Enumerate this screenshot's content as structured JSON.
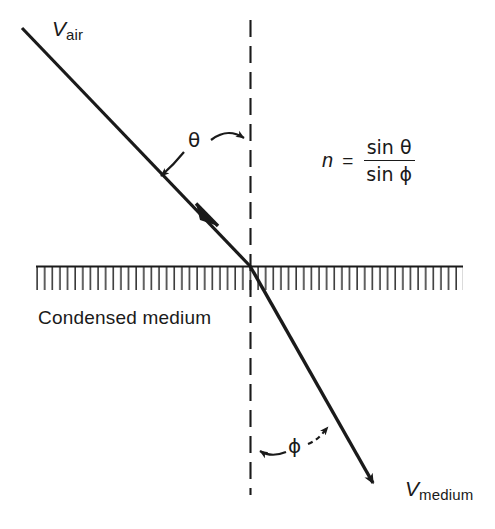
{
  "diagram": {
    "labels": {
      "v_air_symbol": "V",
      "v_air_subscript": "air",
      "v_medium_symbol": "V",
      "v_medium_subscript": "medium",
      "medium": "Condensed medium",
      "angle_incidence": "θ",
      "angle_refraction": "ϕ"
    },
    "formula": {
      "variable": "n",
      "equals": "=",
      "numerator": "sin θ",
      "denominator": "sin ϕ"
    },
    "colors": {
      "ink": "#1a1a1a",
      "background": "#ffffff",
      "hatch": "#2b2b2b"
    },
    "geometry": {
      "interface_y": 266,
      "hatch_left": 36,
      "hatch_right": 463,
      "hatch_depth": 26,
      "normal_x": 250,
      "normal_top": 20,
      "normal_bottom": 495,
      "incident_start": [
        22,
        28
      ],
      "intersection": [
        250,
        266
      ],
      "refracted_end": [
        379,
        490
      ]
    }
  }
}
